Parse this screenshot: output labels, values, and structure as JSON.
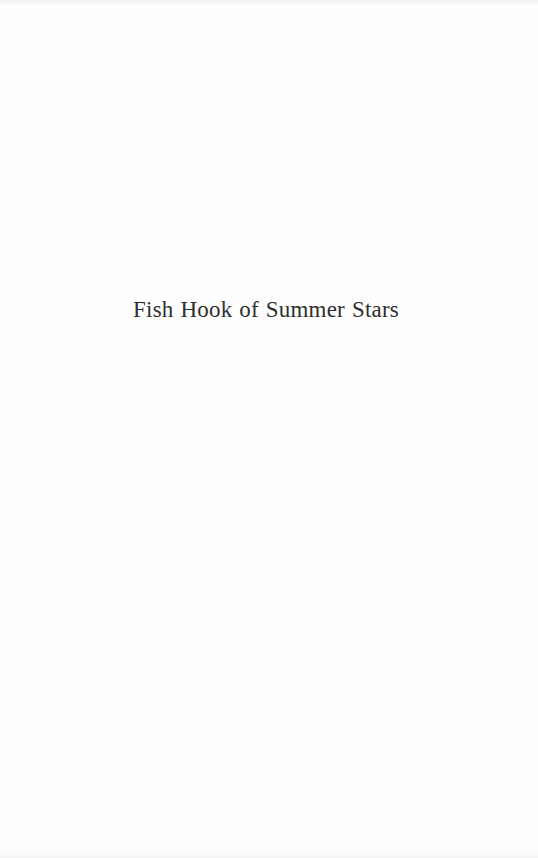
{
  "page": {
    "title": "Fish Hook of Summer Stars",
    "background_color": "#fefefe",
    "text_color": "#2e2e2e"
  }
}
